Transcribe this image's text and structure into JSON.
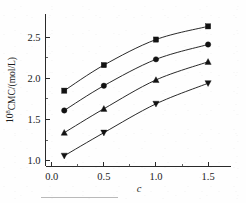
{
  "figure": {
    "background_color": "#fefefe",
    "ink_color": "#1a1a1a",
    "caption_rule_visible": true
  },
  "chart_data": {
    "type": "line",
    "title": "",
    "subtitle": "",
    "xlabel": "c",
    "ylabel": "10⁸CMC/(mol/L)",
    "ylabel_base": "10",
    "ylabel_exponent": "8",
    "ylabel_rest": "CMC/(mol/L)",
    "xlim": [
      -0.06,
      1.72
    ],
    "ylim": [
      0.93,
      2.78
    ],
    "xticks": [
      0.0,
      0.5,
      1.0,
      1.5
    ],
    "xtick_labels": [
      "0.0",
      "0.5",
      "1.0",
      "1.5"
    ],
    "yticks": [
      1.0,
      1.5,
      2.0,
      2.5
    ],
    "ytick_labels": [
      "1.0",
      "1.5",
      "2.0",
      "2.5"
    ],
    "x_minor_ticks": [
      0.25,
      0.75,
      1.25
    ],
    "y_minor_ticks": [
      1.25,
      1.75,
      2.25
    ],
    "grid": false,
    "legend": false,
    "legend_position": "none",
    "tick_direction": "in",
    "spines": [
      "left",
      "bottom"
    ],
    "x": [
      0.12,
      0.5,
      1.0,
      1.5
    ],
    "series": [
      {
        "name": "series-1",
        "marker": "square",
        "color": "#121212",
        "values": [
          1.85,
          2.16,
          2.47,
          2.63
        ]
      },
      {
        "name": "series-2",
        "marker": "circle",
        "color": "#121212",
        "values": [
          1.61,
          1.91,
          2.23,
          2.41
        ]
      },
      {
        "name": "series-3",
        "marker": "triangle-up",
        "color": "#121212",
        "values": [
          1.34,
          1.63,
          1.98,
          2.2
        ]
      },
      {
        "name": "series-4",
        "marker": "triangle-down",
        "color": "#121212",
        "values": [
          1.06,
          1.34,
          1.69,
          1.94
        ]
      }
    ]
  }
}
